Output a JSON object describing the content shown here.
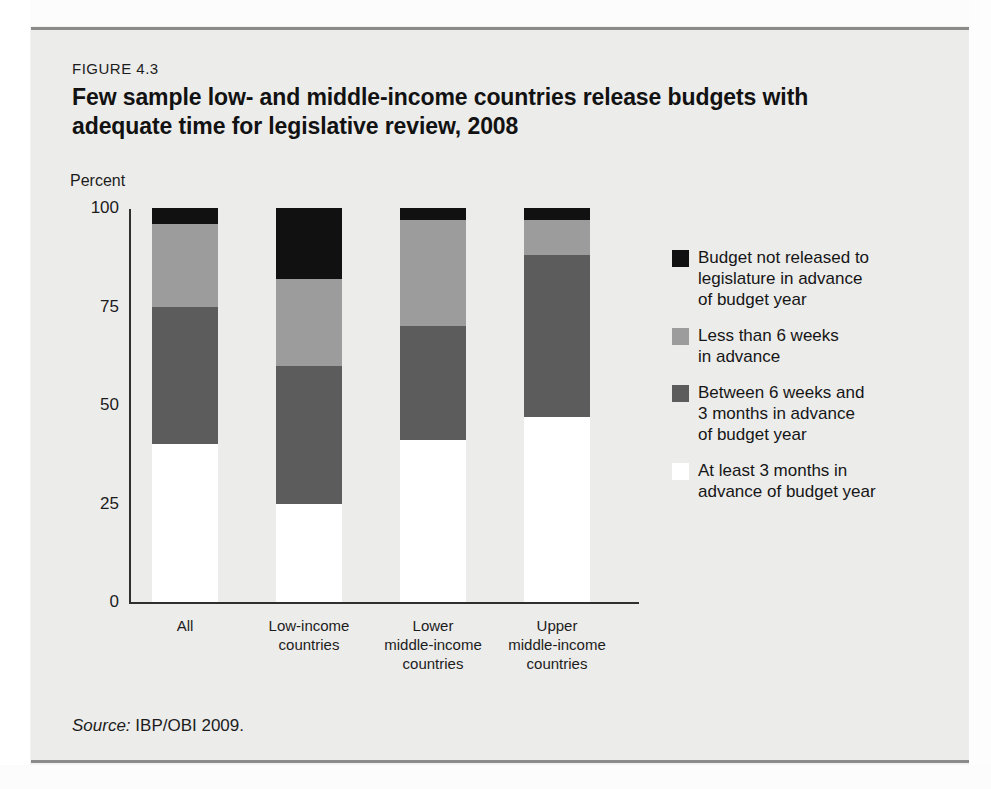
{
  "figure": {
    "number": "FIGURE 4.3",
    "title": "Few sample low- and middle-income countries release budgets with adequate time for legislative review, 2008",
    "source_label": "Source:",
    "source_text": " IBP/OBI 2009."
  },
  "chart_data": {
    "type": "bar",
    "stacked": true,
    "title": "Few sample low- and middle-income countries release budgets with adequate time for legislative review, 2008",
    "xlabel": "",
    "ylabel": "Percent",
    "ylim": [
      0,
      100
    ],
    "yticks": [
      "0",
      "25",
      "50",
      "75",
      "100"
    ],
    "grid": false,
    "legend_position": "right",
    "categories": [
      "All",
      "Low-income countries",
      "Lower middle-income countries",
      "Upper middle-income countries"
    ],
    "category_lines": [
      [
        "All"
      ],
      [
        "Low-income",
        "countries"
      ],
      [
        "Lower",
        "middle-income",
        "countries"
      ],
      [
        "Upper",
        "middle-income",
        "countries"
      ]
    ],
    "series": [
      {
        "name": "At least 3 months in advance of budget year",
        "color": "#ffffff",
        "values": [
          40,
          25,
          41,
          47
        ]
      },
      {
        "name": "Between 6 weeks and 3 months in advance of budget year",
        "color": "#5c5c5c",
        "values": [
          35,
          35,
          29,
          41
        ]
      },
      {
        "name": "Less than 6 weeks in advance",
        "color": "#9c9c9c",
        "values": [
          21,
          22,
          27,
          9
        ]
      },
      {
        "name": "Budget not released to legislature in advance of budget year",
        "color": "#111111",
        "values": [
          4,
          18,
          3,
          3
        ]
      }
    ]
  },
  "legend": {
    "items": [
      {
        "color": "#111111",
        "lines": [
          "Budget not released to",
          "legislature in advance",
          "of budget year"
        ]
      },
      {
        "color": "#9c9c9c",
        "lines": [
          "Less than 6 weeks",
          "in advance"
        ]
      },
      {
        "color": "#5c5c5c",
        "lines": [
          "Between 6 weeks and",
          "3 months in advance",
          "of budget year"
        ]
      },
      {
        "color": "#ffffff",
        "lines": [
          "At least 3 months in",
          "advance of budget year"
        ]
      }
    ]
  }
}
